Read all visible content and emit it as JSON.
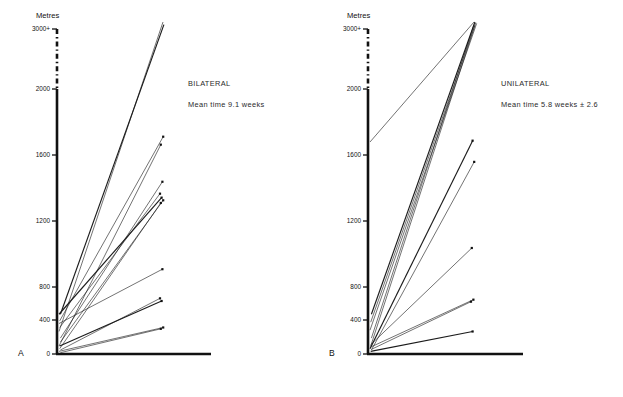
{
  "figure": {
    "caption": "",
    "panels": [
      {
        "id": "A",
        "letter": "A",
        "title": "BILATERAL",
        "subtitle": "Mean time 9.1 weeks",
        "axis_title": "Metres",
        "letter_x": 18,
        "letter_y": 356
      },
      {
        "id": "B",
        "letter": "B",
        "title": "UNILATERAL",
        "subtitle": "Mean time 5.8 weeks ± 2.6",
        "axis_title": "Metres",
        "letter_x": 18,
        "letter_y": 356
      }
    ]
  },
  "chart_data": [
    {
      "type": "line",
      "panel": "A",
      "title": "BILATERAL",
      "annotation": "Mean time 9.1 weeks",
      "ylabel": "Metres",
      "xlabel": "",
      "ylim": [
        0,
        3000
      ],
      "yticks": [
        0,
        400,
        800,
        1200,
        1600,
        2000,
        3000
      ],
      "ytick_labels": [
        "0",
        "400",
        "800",
        "1200",
        "1600",
        "2000",
        "3000+"
      ],
      "axis_break_between": [
        2000,
        3000
      ],
      "grid": false,
      "legend": "none",
      "x_is_time": true,
      "series_note": "each line joins a patient's pre-treatment walking distance (left, near axis) to post-treatment distance (right endpoint, square marker)",
      "series": [
        {
          "name": "p1",
          "start": [
            0,
            170
          ],
          "end": [
            100,
            3000
          ]
        },
        {
          "name": "p2",
          "start": [
            0,
            300
          ],
          "end": [
            100,
            2960
          ]
        },
        {
          "name": "p3",
          "start": [
            0,
            250
          ],
          "end": [
            100,
            1640
          ]
        },
        {
          "name": "p4",
          "start": [
            0,
            60
          ],
          "end": [
            100,
            1580
          ]
        },
        {
          "name": "p5",
          "start": [
            0,
            120
          ],
          "end": [
            100,
            1300
          ]
        },
        {
          "name": "p6",
          "start": [
            0,
            200
          ],
          "end": [
            100,
            1210
          ]
        },
        {
          "name": "p7",
          "start": [
            0,
            300
          ],
          "end": [
            100,
            1180
          ]
        },
        {
          "name": "p8",
          "start": [
            0,
            90
          ],
          "end": [
            100,
            1160
          ]
        },
        {
          "name": "p9",
          "start": [
            0,
            40
          ],
          "end": [
            100,
            1140
          ]
        },
        {
          "name": "p10",
          "start": [
            0,
            230
          ],
          "end": [
            100,
            640
          ]
        },
        {
          "name": "p11",
          "start": [
            0,
            30
          ],
          "end": [
            100,
            420
          ]
        },
        {
          "name": "p12",
          "start": [
            0,
            60
          ],
          "end": [
            100,
            400
          ]
        },
        {
          "name": "p13",
          "start": [
            0,
            20
          ],
          "end": [
            100,
            200
          ]
        },
        {
          "name": "p14",
          "start": [
            0,
            10
          ],
          "end": [
            100,
            190
          ]
        }
      ]
    },
    {
      "type": "line",
      "panel": "B",
      "title": "UNILATERAL",
      "annotation": "Mean time 5.8 weeks ± 2.6",
      "ylabel": "Metres",
      "xlabel": "",
      "ylim": [
        0,
        3000
      ],
      "yticks": [
        0,
        400,
        800,
        1200,
        1600,
        2000,
        3000
      ],
      "ytick_labels": [
        "0",
        "400",
        "800",
        "1200",
        "1600",
        "2000",
        "3000+"
      ],
      "axis_break_between": [
        2000,
        3000
      ],
      "grid": false,
      "legend": "none",
      "x_is_time": true,
      "series_note": "each line joins a patient's pre-treatment walking distance (left, near axis) to post-treatment distance (right endpoint, square marker)",
      "series": [
        {
          "name": "q1",
          "start": [
            0,
            1600
          ],
          "end": [
            100,
            3000
          ]
        },
        {
          "name": "q2",
          "start": [
            0,
            300
          ],
          "end": [
            100,
            3000
          ]
        },
        {
          "name": "q3",
          "start": [
            0,
            240
          ],
          "end": [
            100,
            2990
          ]
        },
        {
          "name": "q4",
          "start": [
            0,
            180
          ],
          "end": [
            100,
            2980
          ]
        },
        {
          "name": "q5",
          "start": [
            0,
            120
          ],
          "end": [
            100,
            2960
          ]
        },
        {
          "name": "q6",
          "start": [
            0,
            60
          ],
          "end": [
            100,
            2950
          ]
        },
        {
          "name": "q7",
          "start": [
            0,
            40
          ],
          "end": [
            100,
            1610
          ]
        },
        {
          "name": "q8",
          "start": [
            0,
            30
          ],
          "end": [
            100,
            1450
          ]
        },
        {
          "name": "q9",
          "start": [
            0,
            70
          ],
          "end": [
            100,
            800
          ]
        },
        {
          "name": "q10",
          "start": [
            0,
            50
          ],
          "end": [
            100,
            410
          ]
        },
        {
          "name": "q11",
          "start": [
            0,
            35
          ],
          "end": [
            100,
            395
          ]
        },
        {
          "name": "q12",
          "start": [
            0,
            20
          ],
          "end": [
            100,
            170
          ]
        }
      ]
    }
  ]
}
